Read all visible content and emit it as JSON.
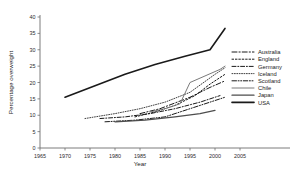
{
  "chart_data": {
    "type": "line",
    "title": "",
    "xlabel": "Year",
    "ylabel": "Percentage overweight",
    "xlim": [
      1965,
      2005
    ],
    "ylim": [
      0,
      40
    ],
    "xticks": [
      1965,
      1970,
      1975,
      1980,
      1985,
      1990,
      1995,
      2000,
      2005
    ],
    "yticks": [
      0,
      5,
      10,
      15,
      20,
      25,
      30,
      35,
      40
    ],
    "grid": false,
    "legend_position": "right",
    "series": [
      {
        "name": "Australia",
        "style": "dash-dot-long",
        "color": "#1a1a1a",
        "x": [
          1985,
          1989,
          1995,
          1999,
          2002
        ],
        "y": [
          10.5,
          12.0,
          15.5,
          18.5,
          20.5
        ]
      },
      {
        "name": "England",
        "style": "dotted-dash",
        "color": "#1a1a1a",
        "x": [
          1984,
          1988,
          1992,
          1996,
          1999,
          2002
        ],
        "y": [
          9.5,
          11.0,
          13.0,
          16.0,
          19.5,
          22.5
        ]
      },
      {
        "name": "Germany",
        "style": "dash-dot",
        "color": "#1a1a1a",
        "x": [
          1977,
          1982,
          1987,
          1992,
          1997,
          2001
        ],
        "y": [
          9.0,
          9.5,
          10.5,
          12.0,
          14.0,
          16.0
        ]
      },
      {
        "name": "Iceland",
        "style": "fine-dotted",
        "color": "#2b2b2b",
        "x": [
          1974,
          1980,
          1985,
          1990,
          1995,
          2000,
          2002
        ],
        "y": [
          9.0,
          10.5,
          12.0,
          14.0,
          17.0,
          22.5,
          24.5
        ]
      },
      {
        "name": "Scotland",
        "style": "dash-dot-dot",
        "color": "#1a1a1a",
        "x": [
          1978,
          1984,
          1990,
          1994,
          1998,
          2002
        ],
        "y": [
          8.0,
          8.5,
          9.5,
          11.5,
          13.5,
          15.5
        ]
      },
      {
        "name": "Chile",
        "style": "solid-thin-gray",
        "color": "#7a7a7a",
        "x": [
          1987,
          1990,
          1993,
          1995,
          1998,
          2001,
          2002
        ],
        "y": [
          11.0,
          12.0,
          13.5,
          20.0,
          22.0,
          24.0,
          25.0
        ]
      },
      {
        "name": "Japan",
        "style": "solid-medium",
        "color": "#4d4d4d",
        "x": [
          1980,
          1986,
          1992,
          1997,
          2000
        ],
        "y": [
          8.0,
          8.5,
          9.5,
          10.5,
          11.5
        ]
      },
      {
        "name": "USA",
        "style": "solid-thick",
        "color": "#1a1a1a",
        "x": [
          1970,
          1976,
          1982,
          1988,
          1994,
          1999,
          2002
        ],
        "y": [
          15.5,
          19.0,
          22.5,
          25.5,
          28.0,
          30.0,
          36.5
        ]
      }
    ]
  }
}
